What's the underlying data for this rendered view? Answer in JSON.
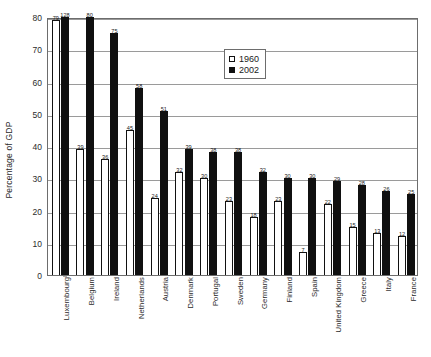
{
  "chart_data": {
    "type": "bar",
    "title": "",
    "xlabel": "",
    "ylabel": "Percentage of GDP",
    "ylim": [
      0,
      80
    ],
    "ytick_step": 10,
    "yticks": [
      0,
      10,
      20,
      30,
      40,
      50,
      60,
      70,
      80
    ],
    "grid": true,
    "legend_position": "upper-center",
    "note": "Luxembourg 2002 value of 128 exceeds the axis maximum of 80; its bar is clipped at the top of the plot area.",
    "categories": [
      "Luxembourg",
      "Belgium",
      "Ireland",
      "Netherlands",
      "Austria",
      "Denmark",
      "Portugal",
      "Sweden",
      "Germany",
      "Finland",
      "Spain",
      "United Kingdom",
      "Greece",
      "Italy",
      "France"
    ],
    "series": [
      {
        "name": "1960",
        "color": "#ffffff",
        "values": [
          79,
          39,
          36,
          45,
          24,
          32,
          30,
          23,
          18,
          23,
          7,
          22,
          15,
          13,
          12
        ]
      },
      {
        "name": "2002",
        "color": "#101010",
        "values": [
          128,
          80,
          75,
          58,
          51,
          39,
          38,
          38,
          32,
          30,
          30,
          29,
          28,
          26,
          25
        ]
      }
    ]
  },
  "legend": {
    "entries": [
      {
        "label": "1960"
      },
      {
        "label": "2002"
      }
    ]
  },
  "caption": {
    "text": ""
  }
}
